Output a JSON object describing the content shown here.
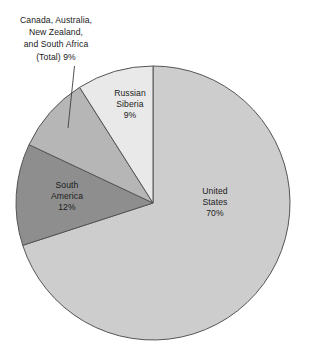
{
  "chart_data": {
    "type": "pie",
    "title": "",
    "subtitle": "",
    "xlabel": "",
    "ylabel": "",
    "legend_position": "none",
    "grid": false,
    "units": "percent",
    "start_angle_deg": 0,
    "direction": "clockwise",
    "categories": [
      "United States",
      "South America",
      "Canada, Australia, New Zealand, and South Africa (Total)",
      "Russian Siberia"
    ],
    "values": [
      70,
      12,
      9,
      9
    ],
    "colors": [
      "#cdcdcd",
      "#8e8e8e",
      "#b6b6b6",
      "#e9e9e9"
    ],
    "slices": [
      {
        "key": "united-states",
        "name": "United States",
        "value": 70,
        "value_label": "70%",
        "color": "#cdcdcd",
        "label_placement": "inside",
        "label_lines": [
          "United",
          "States",
          "70%"
        ]
      },
      {
        "key": "south-america",
        "name": "South America",
        "value": 12,
        "value_label": "12%",
        "color": "#8e8e8e",
        "label_placement": "inside",
        "label_lines": [
          "South",
          "America",
          "12%"
        ]
      },
      {
        "key": "canada-australia-new-zealand-south-africa",
        "name": "Canada, Australia, New Zealand, and South Africa (Total)",
        "value": 9,
        "value_label": "9%",
        "color": "#b6b6b6",
        "label_placement": "outside-leader",
        "label_lines": [
          "Canada, Australia,",
          "New Zealand,",
          "and South Africa",
          "(Total)  9%"
        ]
      },
      {
        "key": "russian-siberia",
        "name": "Russian Siberia",
        "value": 9,
        "value_label": "9%",
        "color": "#e9e9e9",
        "label_placement": "inside",
        "label_lines": [
          "Russian",
          "Siberia",
          "9%"
        ]
      }
    ]
  },
  "labels": {
    "united_states": {
      "line1": "United",
      "line2": "States",
      "line3": "70%"
    },
    "south_america": {
      "line1": "South",
      "line2": "America",
      "line3": "12%"
    },
    "russian_siberia": {
      "line1": "Russian",
      "line2": "Siberia",
      "line3": "9%"
    },
    "canada_group": {
      "line1": "Canada, Australia,",
      "line2": "New Zealand,",
      "line3": "and South Africa",
      "line4": "(Total)  9%"
    }
  },
  "style": {
    "background": "#ffffff",
    "outline": "#555555",
    "leader_line": "#3f3f3f",
    "text": "#1b1b1b"
  }
}
